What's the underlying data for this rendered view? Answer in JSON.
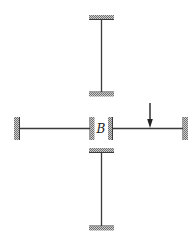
{
  "diagram": {
    "type": "structural-frame",
    "joint_label": "B",
    "members": [
      {
        "name": "top-member",
        "orientation": "vertical",
        "supports": [
          "fixed",
          "fixed"
        ]
      },
      {
        "name": "left-member",
        "orientation": "horizontal",
        "supports": [
          "fixed",
          "fixed"
        ]
      },
      {
        "name": "right-member",
        "orientation": "horizontal",
        "supports": [
          "fixed",
          "fixed"
        ],
        "load": "point-load-downward"
      },
      {
        "name": "bottom-member",
        "orientation": "vertical",
        "supports": [
          "fixed",
          "fixed"
        ]
      }
    ],
    "load": {
      "type": "concentrated",
      "direction": "down",
      "on_member": "right-member"
    },
    "colors": {
      "line": "#3a3a3a",
      "hatch": "#8a8a8a",
      "background": "#ffffff"
    }
  }
}
